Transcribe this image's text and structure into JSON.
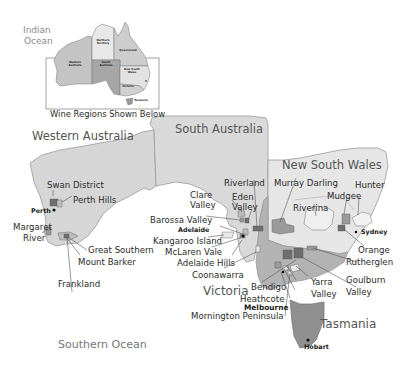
{
  "inset": {
    "caption": "Wine Regions Shown Below",
    "states": [
      {
        "name": "Western Australia",
        "label": "Western\nAustralia"
      },
      {
        "name": "Northern Territory",
        "label": "Northern\nTerritory"
      },
      {
        "name": "Queensland",
        "label": "Queensland"
      },
      {
        "name": "South Australia",
        "label": "South\nAustralia"
      },
      {
        "name": "New South Wales",
        "label": "New\nSouth\nWales"
      },
      {
        "name": "Victoria",
        "label": "Victoria"
      },
      {
        "name": "Tasmania",
        "label": "Tasmania"
      }
    ]
  },
  "oceans": {
    "indian": "Indian\nOcean",
    "indian_line1": "Indian",
    "indian_line2": "Ocean",
    "southern": "Southern Ocean"
  },
  "states": {
    "wa": "Western Australia",
    "sa": "South Australia",
    "nsw": "New South Wales",
    "vic": "Victoria",
    "tas": "Tasmania"
  },
  "regions": {
    "wa": [
      "Swan District",
      "Perth Hills",
      "Margaret River",
      "Great Southern",
      "Mount Barker",
      "Frankland"
    ],
    "sa": [
      "Clare Valley",
      "Eden Valley",
      "Riverland",
      "Barossa Valley",
      "Kangaroo Island",
      "McLaren Vale",
      "Adelaide Hills",
      "Coonawarra"
    ],
    "nsw": [
      "Murray Darling",
      "Hunter",
      "Mudgee",
      "Riverina",
      "Orange"
    ],
    "vic": [
      "Rutherglen",
      "Goulburn Valley",
      "Yarra Valley",
      "Bendigo",
      "Heathcote",
      "Mornington Peninsula"
    ]
  },
  "labels": {
    "swan": "Swan District",
    "perth_hills": "Perth Hills",
    "margaret1": "Margaret",
    "margaret2": "River",
    "great_southern": "Great Southern",
    "mount_barker": "Mount Barker",
    "frankland": "Frankland",
    "clare1": "Clare",
    "clare2": "Valley",
    "eden1": "Eden",
    "eden2": "Valley",
    "riverland": "Riverland",
    "barossa": "Barossa Valley",
    "kangaroo": "Kangaroo Island",
    "mclaren": "McLaren Vale",
    "adelaide_hills": "Adelaide Hills",
    "coonawarra": "Coonawarra",
    "murray": "Murray Darling",
    "hunter": "Hunter",
    "mudgee": "Mudgee",
    "riverina": "Riverina",
    "orange": "Orange",
    "rutherglen": "Rutherglen",
    "goulburn1": "Goulburn",
    "goulburn2": "Valley",
    "yarra1": "Yarra",
    "yarra2": "Valley",
    "bendigo": "Bendigo",
    "heathcote": "Heathcote",
    "mornington": "Mornington Peninsula"
  },
  "cities": {
    "perth": "Perth",
    "adelaide": "Adelaide",
    "sydney": "Sydney",
    "melbourne": "Melbourne",
    "hobart": "Hobart"
  },
  "mini_labels": {
    "wa": "Western Australia",
    "nt": "Northern Territory",
    "qld": "Queensland",
    "sa": "South Australia",
    "nsw": "New South Wales",
    "vic": "Victoria",
    "tas": "Tasmania"
  },
  "colors": {
    "land": "#d6d6d6",
    "land_light": "#e6e6e6",
    "vic": "#b3b3b3",
    "region_dark": "#6e6e6e",
    "region_mid": "#9a9a9a",
    "border": "#8c8c8c",
    "text": "#333333"
  }
}
